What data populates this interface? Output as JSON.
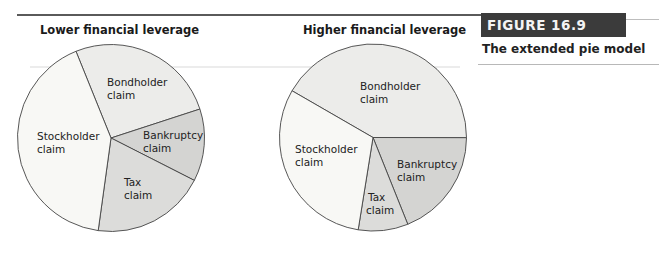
{
  "figure": {
    "label": "FIGURE 16.9",
    "subtitle": "The extended pie model"
  },
  "colors": {
    "stockholder": "#f8f8f5",
    "bondholder": "#ececea",
    "bankruptcy": "#d4d4d2",
    "tax": "#dcdcda",
    "outline": "#444444",
    "figure_box": "#3b3b3b"
  },
  "chart_data": [
    {
      "type": "pie",
      "title": "Lower financial leverage",
      "categories": [
        "Bondholder claim",
        "Bankruptcy claim",
        "Tax claim",
        "Stockholder claim"
      ],
      "values": [
        26.1,
        12.5,
        19.7,
        41.7
      ],
      "labels": [
        {
          "line1": "Bondholder",
          "line2": "claim"
        },
        {
          "line1": "Bankruptcy",
          "line2": "claim"
        },
        {
          "line1": "Tax",
          "line2": "claim"
        },
        {
          "line1": "Stockholder",
          "line2": "claim"
        }
      ],
      "start_angle_deg": -112,
      "units": "approx. % of pie (estimated from slice angles)"
    },
    {
      "type": "pie",
      "title": "Higher financial leverage",
      "categories": [
        "Bondholder claim",
        "Bankruptcy claim",
        "Tax claim",
        "Stockholder claim"
      ],
      "values": [
        41.7,
        18.9,
        8.6,
        30.8
      ],
      "labels": [
        {
          "line1": "Bondholder",
          "line2": "claim"
        },
        {
          "line1": "Bankruptcy",
          "line2": "claim"
        },
        {
          "line1": "Tax",
          "line2": "claim"
        },
        {
          "line1": "Stockholder",
          "line2": "claim"
        }
      ],
      "start_angle_deg": -150,
      "units": "approx. % of pie (estimated from slice angles)"
    }
  ]
}
